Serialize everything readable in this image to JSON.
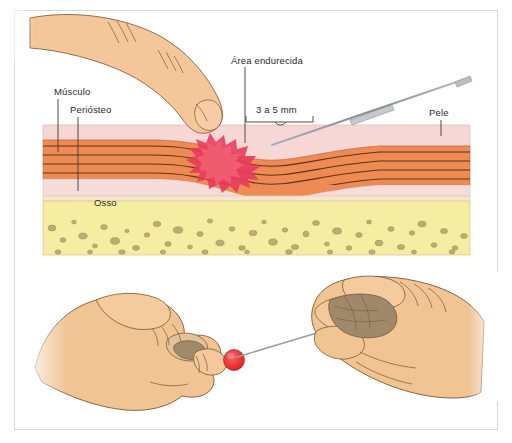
{
  "figure": {
    "language": "pt-BR",
    "panels": [
      {
        "id": "cross-section",
        "name": "Corte transversal dos tecidos",
        "description": "Corte transversal mostrando pele, musculo, periosteo e osso com dedo pressionando e agulha"
      },
      {
        "id": "hands",
        "name": "Maos segurando a agulha",
        "description": "Mao esquerda em punho com dedo indicador estendido e ponto vermelho; mao direita segurando a agulha"
      }
    ]
  },
  "labels": {
    "area_endurecida": "Área endurecida",
    "musculo": "Músculo",
    "periosteo": "Periósteo",
    "medida": "3 a 5 mm",
    "pele": "Pele",
    "osso": "Osso"
  },
  "icons": {
    "needle": "needle-icon",
    "finger": "finger-icon",
    "hand_left": "hand-fist-icon",
    "hand_right": "hand-pinch-icon",
    "red_spot": "injection-site-icon",
    "bracket": "measurement-bracket-icon"
  },
  "colors": {
    "frame_border": "#d8d8d8",
    "background": "#ffffff",
    "skin_layer": "#f6d2d2",
    "muscle_layer": "#ef8a52",
    "muscle_fiber_line": "#6b3a1f",
    "periosteum_layer": "#f7dada",
    "periosteum_band": "#f3e3cf",
    "bone_layer": "#f4eda0",
    "bone_speckle": "#b9ab6d",
    "hardened_area": "#e8395c",
    "hardened_area_inner": "#ef5f72",
    "skin_tone": "#f4c79a",
    "skin_tone_hand": "#efc293",
    "skin_outline": "#7a5a3a",
    "needle_body": "#9aa0a4",
    "needle_hub": "#c3c8cc",
    "leader_line": "#4a4a4a",
    "label_text": "#2a2a2a",
    "red_spot": "#ed3a3a"
  },
  "cross_section": {
    "layers": [
      {
        "name": "Pele",
        "color": "#f6d2d2",
        "order": 1
      },
      {
        "name": "Músculo",
        "color": "#ef8a52",
        "order": 2
      },
      {
        "name": "Periósteo",
        "color": "#f7dada",
        "order": 3
      },
      {
        "name": "Osso",
        "color": "#f4eda0",
        "order": 4
      }
    ],
    "muscle_fiber_count": 5,
    "needle_angle_text": "agulha inclinada",
    "measurement": "3 a 5 mm"
  }
}
